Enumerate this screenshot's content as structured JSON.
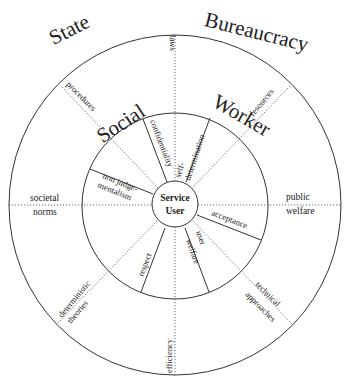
{
  "diagram": {
    "outer_ring": {
      "labels": [
        "State",
        "Bureaucracy"
      ],
      "items": [
        "laws",
        "resources",
        "public",
        "welfare",
        "technical",
        "approaches",
        "efficiency",
        "deterministic",
        "theories",
        "societal",
        "norms",
        "procedures"
      ]
    },
    "middle_ring": {
      "labels": [
        "Social",
        "Worker"
      ],
      "items": [
        "confidentiality",
        "self-",
        "determination",
        "acceptance",
        "user",
        "welfare",
        "respect",
        "non judge-",
        "mentalism"
      ]
    },
    "center": {
      "line1": "Service",
      "line2": "User"
    },
    "colors": {
      "line": "#333333",
      "text": "#222222",
      "background": "#ffffff"
    }
  }
}
